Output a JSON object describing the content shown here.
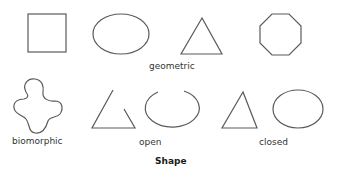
{
  "diagram": {
    "title": "Shape",
    "stroke_color": "#5a5a5a",
    "text_color": "#333333",
    "rows": [
      {
        "label": "geometric",
        "shapes": [
          {
            "name": "square",
            "type": "rect",
            "x": 28,
            "y": 14,
            "width": 38,
            "height": 38
          },
          {
            "name": "ellipse",
            "type": "ellipse",
            "cx": 121,
            "cy": 34,
            "rx": 28,
            "ry": 20
          },
          {
            "name": "triangle",
            "type": "polygon",
            "points": "202,18 181,54 222,54"
          },
          {
            "name": "octagon",
            "type": "polygon",
            "center": [
              280,
              34
            ],
            "radius": 21
          }
        ]
      },
      {
        "groups": [
          {
            "label": "biomorphic",
            "shapes": [
              {
                "name": "biomorphic-blob",
                "type": "path"
              }
            ]
          },
          {
            "label": "open",
            "shapes": [
              {
                "name": "open-triangle",
                "type": "polyline",
                "points": "113,90 92,128 135,128 124,109"
              },
              {
                "name": "open-ellipse",
                "type": "arc",
                "cx": 172,
                "cy": 109,
                "rx": 27,
                "ry": 19
              }
            ]
          },
          {
            "label": "closed",
            "shapes": [
              {
                "name": "closed-triangle",
                "type": "polygon",
                "points": "243,92 222,128 257,128"
              },
              {
                "name": "closed-ellipse",
                "type": "ellipse",
                "cx": 298,
                "cy": 109,
                "rx": 25,
                "ry": 19
              }
            ]
          }
        ]
      }
    ],
    "labels": {
      "geometric": "geometric",
      "biomorphic": "biomorphic",
      "open": "open",
      "closed": "closed"
    }
  }
}
